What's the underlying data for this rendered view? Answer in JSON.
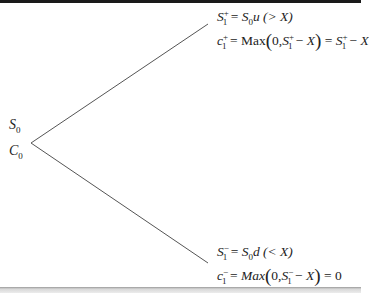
{
  "diagram": {
    "type": "binomial-tree",
    "root": {
      "price_label": "S0",
      "option_label": "C0"
    },
    "up_node": {
      "price_eq": "S1+ = S0u (> X)",
      "option_eq": "c1+ = Max(0, S1+ − X) = S1+ − X"
    },
    "down_node": {
      "price_eq": "S1− = S0d (< X)",
      "option_eq": "c1− = Max(0, S1− − X) = 0"
    },
    "text": {
      "S": "S",
      "C": "C",
      "c": "c",
      "sub0": "0",
      "sub1": "1",
      "plus": "+",
      "minus": "−",
      "eq": "=",
      "u": "u",
      "d": "d",
      "gtX": "(> X)",
      "ltX": "(< X)",
      "Max_up": "Max",
      "Max_down": "Max",
      "X": "X",
      "zero": "0",
      "lparen": "(",
      "rparen": ")",
      "comma": "0,",
      "minusop": "−"
    }
  }
}
